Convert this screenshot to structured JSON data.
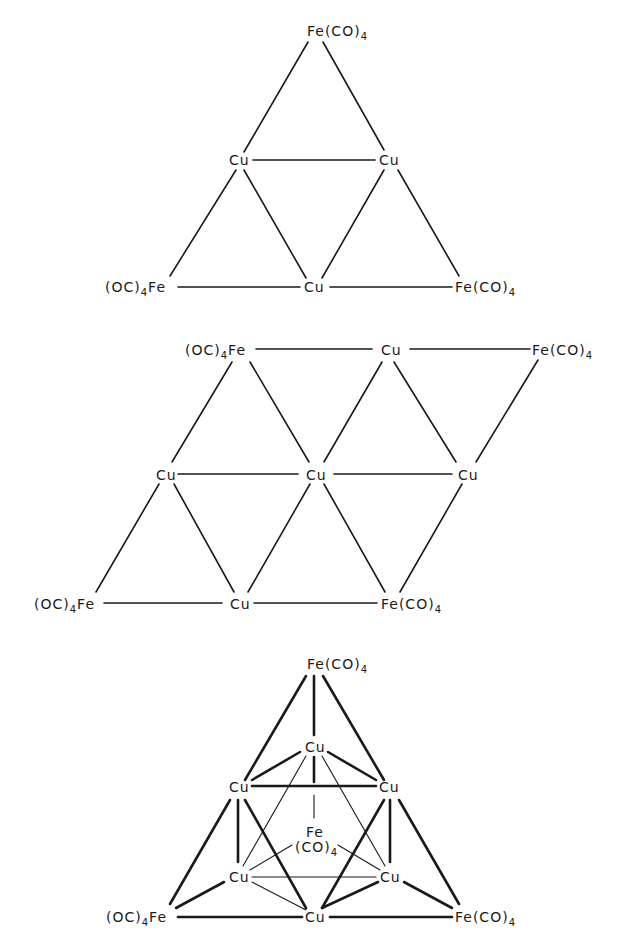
{
  "figures": [
    {
      "id": "structure-1",
      "description": "Planar triangular Cu3Fe3 cluster",
      "atoms": {
        "fe_top": {
          "main": "Fe(CO)",
          "sub": "4"
        },
        "cu_left": {
          "main": "Cu"
        },
        "cu_right": {
          "main": "Cu"
        },
        "fe_bottom_left": {
          "pre": "(OC)",
          "sub": "4",
          "main": "Fe"
        },
        "cu_bottom": {
          "main": "Cu"
        },
        "fe_bottom_right": {
          "main": "Fe(CO)",
          "sub": "4"
        }
      }
    },
    {
      "id": "structure-2",
      "description": "Planar rhombic Cu5Fe4 sheet",
      "atoms": {
        "fe_top_left": {
          "pre": "(OC)",
          "sub": "4",
          "main": "Fe"
        },
        "cu_top": {
          "main": "Cu"
        },
        "fe_top_right": {
          "main": "Fe(CO)",
          "sub": "4"
        },
        "cu_mid_left": {
          "main": "Cu"
        },
        "cu_mid_center": {
          "main": "Cu"
        },
        "cu_mid_right": {
          "main": "Cu"
        },
        "fe_bottom_left": {
          "pre": "(OC)",
          "sub": "4",
          "main": "Fe"
        },
        "cu_bottom": {
          "main": "Cu"
        },
        "fe_bottom_right": {
          "main": "Fe(CO)",
          "sub": "4"
        }
      }
    },
    {
      "id": "structure-3",
      "description": "Three-dimensional Cu6Fe4 cluster (octahedral Cu6 capped by Fe(CO)4)",
      "atoms": {
        "fe_top": {
          "main": "Fe(CO)",
          "sub": "4"
        },
        "cu_apex": {
          "main": "Cu"
        },
        "cu_upper_left": {
          "main": "Cu"
        },
        "cu_upper_right": {
          "main": "Cu"
        },
        "fe_center": {
          "main": "Fe",
          "line2": "(CO)",
          "sub": "4"
        },
        "cu_lower_left": {
          "main": "Cu"
        },
        "cu_lower_right": {
          "main": "Cu"
        },
        "fe_bottom_left": {
          "pre": "(OC)",
          "sub": "4",
          "main": "Fe"
        },
        "cu_bottom": {
          "main": "Cu"
        },
        "fe_bottom_right": {
          "main": "Fe(CO)",
          "sub": "4"
        }
      }
    }
  ]
}
